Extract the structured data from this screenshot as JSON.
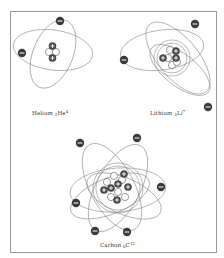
{
  "diagram": {
    "atoms": [
      {
        "name": "Helium",
        "symbol": "He",
        "atomic_number": "2",
        "mass_number": "4",
        "label_text": "Helium",
        "protons": 2,
        "neutrons": 2,
        "electrons": 2
      },
      {
        "name": "Lithium",
        "symbol": "Li",
        "atomic_number": "3",
        "mass_number": "7",
        "label_text": "Lithium",
        "protons": 3,
        "neutrons": 4,
        "electrons": 3
      },
      {
        "name": "Carbon",
        "symbol": "C",
        "atomic_number": "6",
        "mass_number": "12",
        "label_text": "Carbon",
        "protons": 6,
        "neutrons": 6,
        "electrons": 6
      }
    ],
    "symbols": {
      "proton": "+",
      "electron": "−"
    },
    "colors": {
      "orbit": "#8a8a8a",
      "electron": "#3a3a3a",
      "proton": "#4a4a4a",
      "neutron": "#ffffff",
      "frame": "#9a9a9a",
      "label": "#333333"
    }
  }
}
